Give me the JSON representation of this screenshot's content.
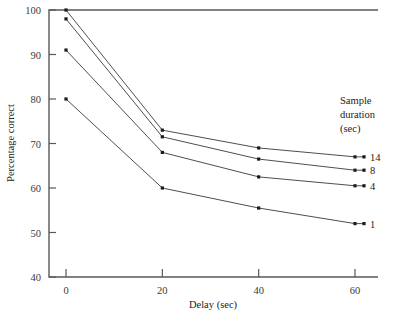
{
  "chart_data": {
    "type": "line",
    "title": "",
    "xlabel": "Delay (sec)",
    "ylabel": "Percentage correct",
    "x": [
      0,
      20,
      40,
      60
    ],
    "xticklabels": [
      "0",
      "20",
      "40",
      "60"
    ],
    "yticklabels": [
      "40",
      "50",
      "60",
      "70",
      "80",
      "90",
      "100"
    ],
    "xlim": [
      -5,
      65
    ],
    "ylim": [
      40,
      100
    ],
    "grid": false,
    "legend_position": "right",
    "legend_title_lines": [
      "Sample",
      "duration",
      "(sec)"
    ],
    "series": [
      {
        "name": "14",
        "values": [
          100,
          73,
          69,
          67
        ]
      },
      {
        "name": "8",
        "values": [
          98,
          71.5,
          66.5,
          64
        ]
      },
      {
        "name": "4",
        "values": [
          91,
          68,
          62.5,
          60.5
        ]
      },
      {
        "name": "1",
        "values": [
          80,
          60,
          55.5,
          52
        ]
      }
    ],
    "colors": {
      "line": "#3a3a3a",
      "marker": "#1a1a1a",
      "axis": "#555a5e"
    }
  }
}
